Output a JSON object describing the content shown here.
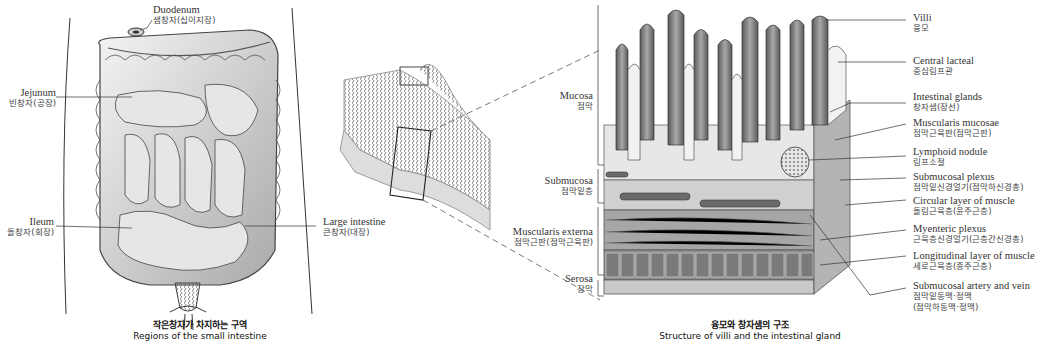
{
  "figure_left": {
    "caption": {
      "ko": "작은창자가 차지하는 구역",
      "en": "Regions of the small intestine"
    },
    "labels": {
      "duodenum": {
        "en": "Duodenum",
        "ko": "샘창자(십이지장)"
      },
      "jejunum": {
        "en": "Jejunum",
        "ko": "빈창자(공장)"
      },
      "ileum": {
        "en": "Ileum",
        "ko": "돌창자(회장)"
      },
      "large_intestine": {
        "en": "Large intestine",
        "ko": "큰창자(대장)"
      }
    }
  },
  "figure_right": {
    "caption": {
      "ko": "융모와 창자샘의 구조",
      "en": "Structure of villi and the intestinal gland"
    },
    "left_labels": {
      "mucosa": {
        "en": "Mucosa",
        "ko": "점막"
      },
      "submucosa": {
        "en": "Submucosa",
        "ko": "점막밑층"
      },
      "muscularis_externa": {
        "en": "Muscularis externa",
        "ko": "점막근판(점막근육판)"
      },
      "serosa": {
        "en": "Serosa",
        "ko": "장막"
      }
    },
    "right_labels": [
      {
        "en": "Villi",
        "ko": "융모"
      },
      {
        "en": "Central lacteal",
        "ko": "중심림프관"
      },
      {
        "en": "Intestinal glands",
        "ko": "창자샘(장선)"
      },
      {
        "en": "Muscularis mucosae",
        "ko": "점막근육판(점막근판)"
      },
      {
        "en": "Lymphoid nodule",
        "ko": "림프소절"
      },
      {
        "en": "Submucosal plexus",
        "ko": "점막밑신경얼기(점막하신경총)"
      },
      {
        "en": "Circular layer of muscle",
        "ko": "돌림근육층(윤주근층)"
      },
      {
        "en": "Myenteric plexus",
        "ko": "근육층신경얼기(근층간신경총)"
      },
      {
        "en": "Longitudinal layer of muscle",
        "ko": "세로근육층(종주근층)"
      },
      {
        "en": "Submucosal artery and vein",
        "ko": "점막밑동맥·정맥",
        "ko2": "(점막하동맥·정맥)"
      }
    ]
  },
  "colors": {
    "ink": "#333333",
    "tissue_dark": "#6e6e6e",
    "tissue_mid": "#9a9a9a",
    "tissue_light": "#d8d8d8"
  }
}
